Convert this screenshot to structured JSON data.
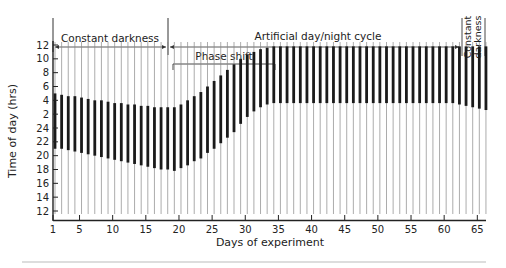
{
  "chart_data": {
    "type": "actogram",
    "title": "",
    "xlabel": "Days of experiment",
    "ylabel": "Time of day (hrs)",
    "x_ticks": [
      1,
      5,
      10,
      15,
      20,
      25,
      30,
      35,
      40,
      45,
      50,
      55,
      60,
      65
    ],
    "y_ticks": [
      "12",
      "10",
      "8",
      "6",
      "4",
      "2",
      "24",
      "22",
      "20",
      "18",
      "16",
      "14",
      "12"
    ],
    "xlim": [
      1,
      66
    ],
    "y_range_hours": "12 (top) to 12 (bottom), double-plotted 24h day",
    "grid": false,
    "annotations": [
      {
        "label": "Constant darkness",
        "from_day": 1,
        "to_day": 18,
        "type": "arrow-span"
      },
      {
        "label": "Artificial day/night cycle",
        "from_day": 18,
        "to_day": 63,
        "type": "arrow-span"
      },
      {
        "label": "Phase shift",
        "from_day": 19,
        "to_day": 34,
        "type": "bracket"
      },
      {
        "label": "Constant darkness",
        "from_day": 63,
        "to_day": 66,
        "type": "vertical-text"
      }
    ],
    "activity_bands": {
      "description": "Dense activity band per day (onset hour to offset hour on the plotted axis, measured as hours above the bottom 12:00).",
      "days": [
        1,
        2,
        3,
        4,
        5,
        6,
        7,
        8,
        9,
        10,
        11,
        12,
        13,
        14,
        15,
        16,
        17,
        18,
        19,
        20,
        21,
        22,
        23,
        24,
        25,
        26,
        27,
        28,
        29,
        30,
        31,
        32,
        33,
        34,
        35,
        36,
        37,
        38,
        39,
        40,
        41,
        42,
        43,
        44,
        45,
        46,
        47,
        48,
        49,
        50,
        51,
        52,
        53,
        54,
        55,
        56,
        57,
        58,
        59,
        60,
        61,
        62,
        63,
        64,
        65,
        66
      ],
      "onset_hour": [
        21,
        21,
        20.8,
        20.6,
        20.4,
        20.2,
        20,
        19.8,
        19.6,
        19.4,
        19.2,
        19,
        18.8,
        18.6,
        18.4,
        18.2,
        18,
        18,
        17.8,
        18.2,
        18.6,
        19.2,
        19.6,
        20.4,
        21,
        21.8,
        22.6,
        23.4,
        24.6,
        25.6,
        26.4,
        27,
        27.4,
        27.6,
        27.6,
        27.6,
        27.6,
        27.6,
        27.6,
        27.6,
        27.6,
        27.6,
        27.6,
        27.6,
        27.6,
        27.6,
        27.6,
        27.6,
        27.6,
        27.6,
        27.6,
        27.6,
        27.6,
        27.6,
        27.6,
        27.6,
        27.6,
        27.6,
        27.6,
        27.6,
        27.6,
        27.4,
        27.2,
        27,
        26.8,
        26.6
      ],
      "offset_hour": [
        29,
        28.8,
        28.6,
        28.6,
        28.4,
        28.2,
        28,
        28,
        27.8,
        27.6,
        27.6,
        27.4,
        27.4,
        27.2,
        27.2,
        27,
        27,
        27,
        27,
        27.4,
        28,
        28.6,
        29.2,
        30,
        30.8,
        31.6,
        32.4,
        33.2,
        34,
        34.6,
        35,
        35.4,
        35.6,
        35.8,
        35.8,
        35.8,
        35.8,
        35.8,
        35.8,
        35.8,
        35.8,
        35.8,
        35.8,
        35.8,
        35.8,
        35.8,
        35.8,
        35.8,
        35.8,
        35.8,
        35.8,
        35.8,
        35.8,
        35.8,
        35.8,
        35.8,
        35.8,
        35.8,
        35.8,
        35.8,
        35.8,
        35.8,
        35.8,
        35.8,
        35.8,
        35.8
      ]
    }
  }
}
